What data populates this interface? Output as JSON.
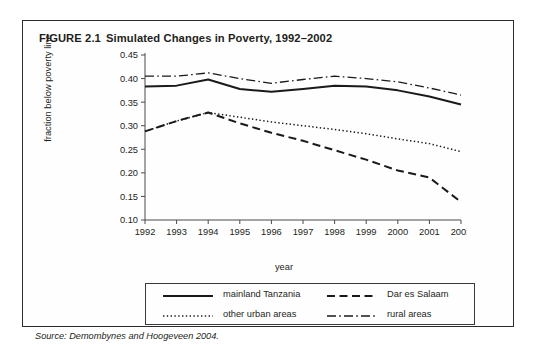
{
  "figure": {
    "number": "FIGURE 2.1",
    "title": "Simulated Changes in Poverty, 1992–2002",
    "source_label": "Source:",
    "source_text": "Demombynes and Hoogeveen 2004.",
    "source_full": "Source: Demombynes and Hoogeveen 2004.",
    "border_color": "#2b2b2b",
    "background": "#fefefe"
  },
  "legend": {
    "items": [
      {
        "label": "mainland Tanzania",
        "style": "solid",
        "icon": "solid-line-swatch"
      },
      {
        "label": "Dar es Salaam",
        "style": "dashed",
        "icon": "dashed-line-swatch"
      },
      {
        "label": "other urban areas",
        "style": "dotted",
        "icon": "dotted-line-swatch"
      },
      {
        "label": "rural areas",
        "style": "dashdot",
        "icon": "dashdot-line-swatch"
      }
    ]
  },
  "chart_data": {
    "type": "line",
    "title": "Simulated Changes in Poverty, 1992–2002",
    "xlabel": "year",
    "ylabel": "fraction below poverty line",
    "x": [
      1992,
      1993,
      1994,
      1995,
      1996,
      1997,
      1998,
      1999,
      2000,
      2001,
      2002
    ],
    "xtick_labels": [
      "1992",
      "1993",
      "1994",
      "1995",
      "1996",
      "1997",
      "1998",
      "1999",
      "2000",
      "2001",
      "2002"
    ],
    "ytick_labels": [
      "0.10",
      "0.15",
      "0.20",
      "0.25",
      "0.30",
      "0.35",
      "0.40",
      "0.45"
    ],
    "ytick_values": [
      0.1,
      0.15,
      0.2,
      0.25,
      0.3,
      0.35,
      0.4,
      0.45
    ],
    "xlim": [
      1992,
      2002
    ],
    "ylim": [
      0.1,
      0.45
    ],
    "grid": false,
    "legend_position": "below-axes",
    "line_color": "#1a1a1a",
    "series": [
      {
        "name": "mainland Tanzania",
        "style": "solid",
        "values": [
          0.383,
          0.385,
          0.398,
          0.378,
          0.372,
          0.378,
          0.385,
          0.383,
          0.375,
          0.362,
          0.345
        ]
      },
      {
        "name": "Dar es Salaam",
        "style": "dashed",
        "values": [
          0.288,
          0.31,
          0.328,
          0.305,
          0.285,
          0.268,
          0.248,
          0.228,
          0.205,
          0.19,
          0.138
        ]
      },
      {
        "name": "other urban areas",
        "style": "dotted",
        "values": [
          0.288,
          0.31,
          0.328,
          0.318,
          0.308,
          0.3,
          0.292,
          0.283,
          0.272,
          0.262,
          0.245
        ]
      },
      {
        "name": "rural areas",
        "style": "dashdot",
        "values": [
          0.405,
          0.405,
          0.412,
          0.4,
          0.39,
          0.398,
          0.405,
          0.4,
          0.393,
          0.38,
          0.365
        ]
      }
    ]
  }
}
